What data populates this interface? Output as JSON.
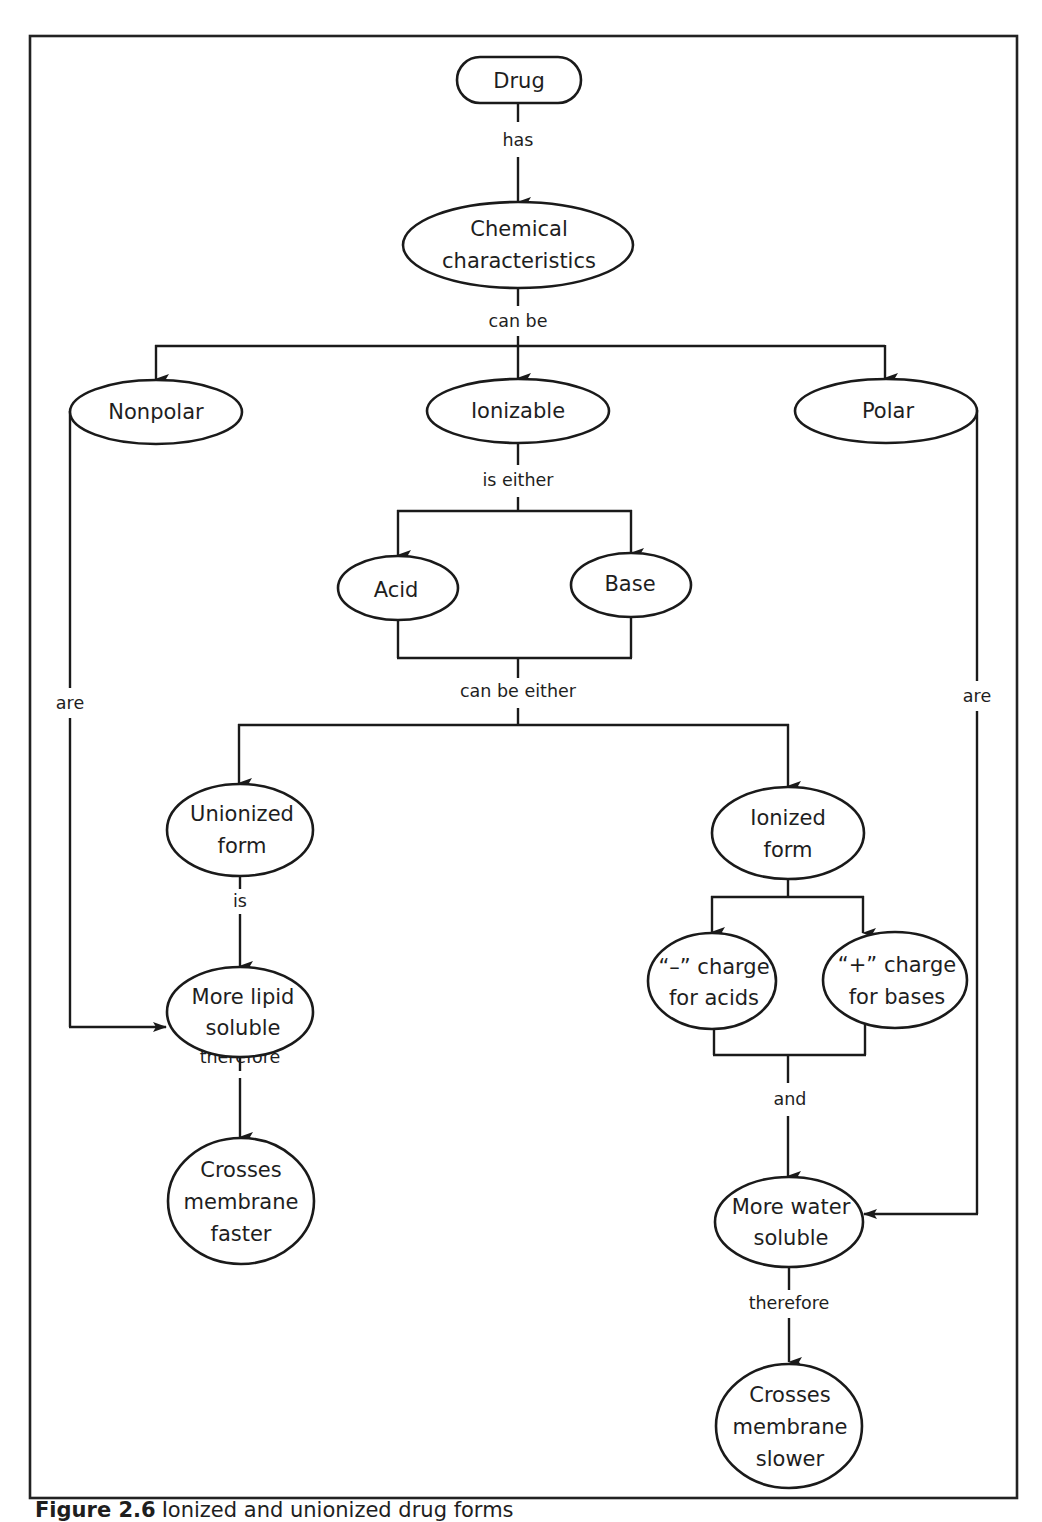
{
  "figure": {
    "caption_label": "Figure 2.6",
    "caption_text": "Ionized and unionized drug forms"
  },
  "nodes": {
    "drug": "Drug",
    "chemical": [
      "Chemical",
      "characteristics"
    ],
    "nonpolar": "Nonpolar",
    "ionizable": "Ionizable",
    "polar": "Polar",
    "acid": "Acid",
    "base": "Base",
    "unionized": [
      "Unionized",
      "form"
    ],
    "ionized": [
      "Ionized",
      "form"
    ],
    "neg_charge": [
      "“–” charge",
      "for acids"
    ],
    "pos_charge": [
      "“+” charge",
      "for bases"
    ],
    "lipid": [
      "More lipid",
      "soluble"
    ],
    "water": [
      "More water",
      "soluble"
    ],
    "faster": [
      "Crosses",
      "membrane",
      "faster"
    ],
    "slower": [
      "Crosses",
      "membrane",
      "slower"
    ]
  },
  "edges": {
    "has": "has",
    "can_be": "can be",
    "is_either": "is either",
    "can_be_either": "can be either",
    "is": "is",
    "are_left": "are",
    "are_right": "are",
    "therefore_left": "therefore",
    "therefore_right": "therefore",
    "and": "and"
  },
  "colors": {
    "stroke": "#1a1a1a",
    "text": "#1e1e1e",
    "background": "#ffffff"
  }
}
